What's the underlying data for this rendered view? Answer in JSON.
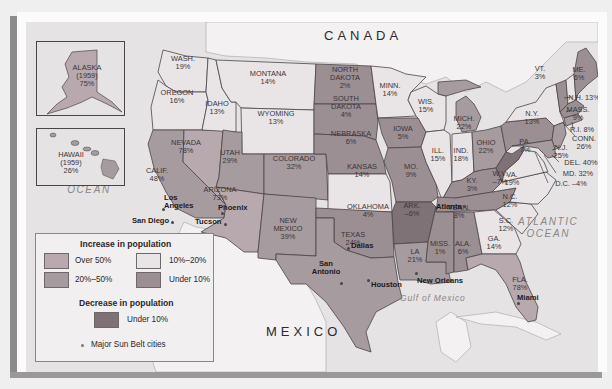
{
  "colors": {
    "over50": "#b7a9ae",
    "r20to50": "#a69b9f",
    "r10to20": "#e9e5e6",
    "under10": "#9b8f94",
    "decrease": "#7f7277",
    "land_other": "#f3f1f2",
    "water": "#e6e3e4"
  },
  "labels": {
    "canada": "CANADA",
    "mexico": "MEXICO",
    "pacific": [
      "PACIFIC",
      "OCEAN"
    ],
    "atlantic": [
      "ATLANTIC",
      "OCEAN"
    ],
    "gulf": "Gulf of Mexico"
  },
  "insets": {
    "alaska": {
      "name": "ALASKA",
      "year": "(1959)",
      "value": "75%"
    },
    "hawaii": {
      "name": "HAWAII",
      "year": "(1959)",
      "value": "26%"
    }
  },
  "states": [
    {
      "id": "wash",
      "name": "WASH.",
      "value": "19%",
      "category": "10%–20%"
    },
    {
      "id": "oregon",
      "name": "OREGON",
      "value": "16%",
      "category": "10%–20%"
    },
    {
      "id": "calif",
      "name": "CALIF.",
      "value": "48%",
      "category": "20%–50%"
    },
    {
      "id": "nevada",
      "name": "NEVADA",
      "value": "78%",
      "category": "Over 50%"
    },
    {
      "id": "idaho",
      "name": "IDAHO",
      "value": "13%",
      "category": "10%–20%"
    },
    {
      "id": "montana",
      "name": "MONTANA",
      "value": "14%",
      "category": "10%–20%"
    },
    {
      "id": "wyoming",
      "name": "WYOMING",
      "value": "13%",
      "category": "10%–20%"
    },
    {
      "id": "utah",
      "name": "UTAH",
      "value": "29%",
      "category": "20%–50%"
    },
    {
      "id": "arizona",
      "name": "ARIZONA",
      "value": "73%",
      "category": "Over 50%"
    },
    {
      "id": "colorado",
      "name": "COLORADO",
      "value": "32%",
      "category": "20%–50%"
    },
    {
      "id": "newmexico",
      "name": "NEW MEXICO",
      "value": "39%",
      "category": "20%–50%"
    },
    {
      "id": "ndakota",
      "name": "NORTH DAKOTA",
      "value": "2%",
      "category": "Under 10%"
    },
    {
      "id": "sdakota",
      "name": "SOUTH DAKOTA",
      "value": "4%",
      "category": "Under 10%"
    },
    {
      "id": "nebraska",
      "name": "NEBRASKA",
      "value": "6%",
      "category": "Under 10%"
    },
    {
      "id": "kansas",
      "name": "KANSAS",
      "value": "14%",
      "category": "10%–20%"
    },
    {
      "id": "oklahoma",
      "name": "OKLAHOMA",
      "value": "4%",
      "category": "Under 10%"
    },
    {
      "id": "texas",
      "name": "TEXAS",
      "value": "24%",
      "category": "20%–50%"
    },
    {
      "id": "minn",
      "name": "MINN.",
      "value": "14%",
      "category": "10%–20%"
    },
    {
      "id": "iowa",
      "name": "IOWA",
      "value": "5%",
      "category": "Under 10%"
    },
    {
      "id": "mo",
      "name": "MO.",
      "value": "9%",
      "category": "Under 10%"
    },
    {
      "id": "ark",
      "name": "ARK.",
      "value": "–6%",
      "category": "Decrease under 10%"
    },
    {
      "id": "la",
      "name": "LA",
      "value": "21%",
      "category": "20%–50%"
    },
    {
      "id": "wis",
      "name": "WIS.",
      "value": "15%",
      "category": "10%–20%"
    },
    {
      "id": "ill",
      "name": "ILL.",
      "value": "15%",
      "category": "10%–20%"
    },
    {
      "id": "mich",
      "name": "MICH.",
      "value": "22%",
      "category": "20%–50%"
    },
    {
      "id": "ind",
      "name": "IND.",
      "value": "18%",
      "category": "10%–20%"
    },
    {
      "id": "ohio",
      "name": "OHIO",
      "value": "22%",
      "category": "20%–50%"
    },
    {
      "id": "ky",
      "name": "KY.",
      "value": "3%",
      "category": "Under 10%"
    },
    {
      "id": "tenn",
      "name": "TENN.",
      "value": "8%",
      "category": "Under 10%"
    },
    {
      "id": "miss",
      "name": "MISS.",
      "value": "1%",
      "category": "Under 10%"
    },
    {
      "id": "ala",
      "name": "ALA.",
      "value": "6%",
      "category": "Under 10%"
    },
    {
      "id": "ga",
      "name": "GA.",
      "value": "14%",
      "category": "10%–20%"
    },
    {
      "id": "fla",
      "name": "FLA.",
      "value": "78%",
      "category": "Over 50%"
    },
    {
      "id": "sc",
      "name": "S.C.",
      "value": "12%",
      "category": "10%–20%"
    },
    {
      "id": "nc",
      "name": "N.C.",
      "value": "12%",
      "category": "10%–20%"
    },
    {
      "id": "va",
      "name": "VA.",
      "value": "19%",
      "category": "10%–20%"
    },
    {
      "id": "wv",
      "name": "W.V.",
      "value": "–7%",
      "category": "Decrease under 10%"
    },
    {
      "id": "pa",
      "name": "PA.",
      "value": "7%",
      "category": "Under 10%"
    },
    {
      "id": "ny",
      "name": "N.Y.",
      "value": "13%",
      "category": "10%–20%"
    },
    {
      "id": "vt",
      "name": "VT.",
      "value": "3%",
      "category": "Under 10%"
    },
    {
      "id": "me",
      "name": "ME.",
      "value": "6%",
      "category": "Under 10%"
    },
    {
      "id": "nh",
      "name": "N.H. 13%",
      "value": "13%",
      "category": "10%–20%"
    },
    {
      "id": "mass",
      "name": "MASS.",
      "value": "9%",
      "category": "Under 10%"
    },
    {
      "id": "ri",
      "name": "R.I. 8%",
      "value": "8%",
      "category": "Under 10%"
    },
    {
      "id": "conn",
      "name": "CONN.",
      "value": "26%",
      "category": "20%–50%"
    },
    {
      "id": "nj",
      "name": "N.J.",
      "value": "25%",
      "category": "20%–50%"
    },
    {
      "id": "del",
      "name": "DEL. 40%",
      "value": "40%",
      "category": "20%–50%"
    },
    {
      "id": "md",
      "name": "MD. 32%",
      "value": "32%",
      "category": "20%–50%"
    },
    {
      "id": "dc",
      "name": "D.C. –4%",
      "value": "–4%",
      "category": "Decrease under 10%"
    }
  ],
  "cities": [
    "Los Angeles",
    "San Diego",
    "Phoenix",
    "Tucson",
    "Dallas",
    "San Antonio",
    "Houston",
    "New Orleans",
    "Atlanta",
    "Miami"
  ],
  "legend": {
    "increase_title": "Increase in population",
    "decrease_title": "Decrease in population",
    "items": {
      "over50": "Over 50%",
      "r20to50": "20%–50%",
      "r10to20": "10%–20%",
      "under10": "Under 10%",
      "decrease": "Under 10%"
    },
    "cities_note": "Major Sun Belt cities"
  }
}
